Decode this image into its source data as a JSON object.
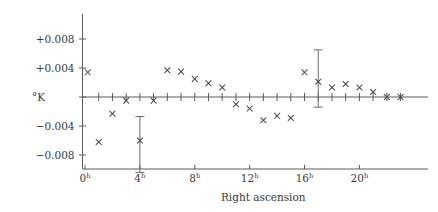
{
  "chart_data": {
    "type": "scatter",
    "title": "",
    "xlabel": "Right ascension",
    "ylabel": "°K",
    "xlim": [
      -0.5,
      24.0
    ],
    "ylim": [
      -0.012,
      0.0115
    ],
    "grid": false,
    "legend": null,
    "x_tick_labels": [
      "0",
      "4",
      "8",
      "12",
      "16",
      "20"
    ],
    "x_tick_suffix": "h",
    "x_tick_values": [
      0,
      4,
      8,
      12,
      16,
      20
    ],
    "x_minor_tick_values": [
      0,
      1,
      2,
      3,
      4,
      5,
      6,
      7,
      8,
      9,
      10,
      11,
      12,
      13,
      14,
      15,
      16,
      17,
      18,
      19,
      20,
      21,
      22,
      23
    ],
    "y_tick_labels": [
      "+0.008",
      "+0.004",
      "−0.004",
      "−0.008"
    ],
    "y_tick_values": [
      0.008,
      0.004,
      -0.004,
      -0.008
    ],
    "zero_line_value": 0,
    "marker": "x",
    "x": [
      0.2,
      1.0,
      2.0,
      3.0,
      4.0,
      5.0,
      6.0,
      7.0,
      8.0,
      9.0,
      10.0,
      11.0,
      12.0,
      13.0,
      14.0,
      15.0,
      16.0,
      17.0,
      18.0,
      19.0,
      20.0,
      21.0,
      22.0,
      23.0
    ],
    "values": [
      0.0034,
      -0.0062,
      -0.0023,
      -0.0005,
      -0.006,
      -0.0005,
      0.0037,
      0.0035,
      0.0025,
      0.0019,
      0.0013,
      -0.001,
      -0.0016,
      -0.0032,
      -0.0026,
      -0.0029,
      0.0034,
      0.0021,
      0.0013,
      0.0018,
      0.0013,
      0.0007,
      0.0,
      0.0
    ],
    "error_bars": [
      {
        "x": 4.0,
        "y": -0.006,
        "low": -0.0104,
        "high": -0.0027
      },
      {
        "x": 17.0,
        "y": 0.0021,
        "low": -0.0014,
        "high": 0.0065
      }
    ]
  },
  "axes": {
    "y_axis_unit_label": "°K",
    "x_axis_title": "Right ascension"
  }
}
